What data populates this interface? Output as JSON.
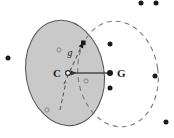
{
  "figure": {
    "title": "",
    "background_color": "#ffffff",
    "canvas": {
      "width": 174,
      "height": 138
    },
    "labels": {
      "center": "C",
      "goal": "G",
      "gradient": "g"
    },
    "colors": {
      "shaded_region_fill": "#c9c9c9",
      "shaded_region_stroke": "#555555",
      "dashed_region_stroke": "#777777",
      "solid_arrow": "#4a4a4a",
      "dashed_arrow": "#555555",
      "filled_point": "#1a1a1a",
      "open_point_stroke": "#8a8a8a",
      "label_text": "#1a1a1a"
    },
    "shapes": {
      "shaded_ellipse": {
        "cx": 65,
        "cy": 73,
        "rx": 39,
        "ry": 53,
        "rotate": -10,
        "style": "solid-filled"
      },
      "dashed_ellipse": {
        "cx": 118,
        "cy": 74,
        "rx": 40,
        "ry": 53,
        "rotate": -8,
        "style": "dashed-open"
      }
    },
    "arrows": {
      "goal_to_center": {
        "x1": 109,
        "y1": 73,
        "x2": 69,
        "y2": 73,
        "style": "solid",
        "head": "left"
      },
      "center_to_boundary": {
        "x1": 66,
        "y1": 78,
        "x2": 84,
        "y2": 44,
        "style": "dashed",
        "head": "up-right"
      }
    },
    "points": {
      "filled": [
        {
          "x": 8,
          "y": 58
        },
        {
          "x": 83,
          "y": 43
        },
        {
          "x": 110,
          "y": 44
        },
        {
          "x": 110,
          "y": 73
        },
        {
          "x": 110,
          "y": 88
        },
        {
          "x": 141,
          "y": 3
        },
        {
          "x": 156,
          "y": 3
        },
        {
          "x": 155,
          "y": 76
        },
        {
          "x": 166,
          "y": 122
        }
      ],
      "open": [
        {
          "x": 59,
          "y": 50
        },
        {
          "x": 47,
          "y": 110
        },
        {
          "x": 86,
          "y": 81
        },
        {
          "x": 68,
          "y": 73
        }
      ]
    }
  }
}
